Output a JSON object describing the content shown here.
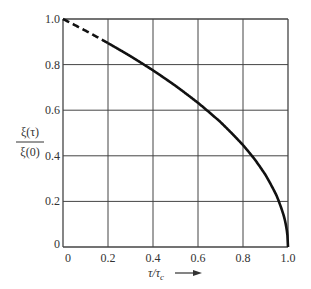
{
  "chart_data": {
    "type": "line",
    "title": "",
    "xlabel": "τ/τc →",
    "ylabel": "ξ(τ)/ξ(0)",
    "xlim": [
      0,
      1.0
    ],
    "ylim": [
      0,
      1.0
    ],
    "grid": true,
    "legend": null,
    "x_ticks": [
      "0",
      "0.2",
      "0.4",
      "0.6",
      "0.8",
      "1.0"
    ],
    "y_ticks": [
      "0",
      "0.2",
      "0.4",
      "0.6",
      "0.8",
      "1.0"
    ],
    "series": [
      {
        "name": "ξ(τ)/ξ(0)",
        "style": "dashed for τ/τc < 0.2, solid thereafter",
        "x": [
          0,
          0.1,
          0.2,
          0.3,
          0.4,
          0.5,
          0.6,
          0.7,
          0.8,
          0.85,
          0.9,
          0.95,
          0.98,
          1.0
        ],
        "y": [
          1.0,
          0.949,
          0.894,
          0.837,
          0.775,
          0.707,
          0.632,
          0.548,
          0.447,
          0.387,
          0.316,
          0.224,
          0.141,
          0.0
        ]
      }
    ],
    "dash_end_x": 0.2
  },
  "labels": {
    "ylabel_num": "ξ(τ)",
    "ylabel_den": "ξ(0)",
    "xlabel_main": "τ/τ",
    "xlabel_sub": "c"
  }
}
